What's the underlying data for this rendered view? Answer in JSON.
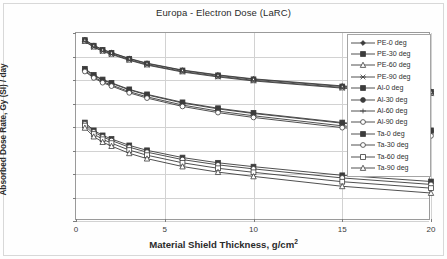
{
  "chart_data": {
    "type": "line",
    "title": "Europa - Electron Dose (LaRC)",
    "xlabel_main": "Material Shield Thickness, g/cm",
    "xlabel_sup": "2",
    "ylabel": "Absorbed Dose Rate, Gy (SI) / day",
    "xlim": [
      0,
      20
    ],
    "ylim": [
      1e-05,
      1000.0
    ],
    "yscale": "log",
    "grid": true,
    "legend_position": "upper-right-inside",
    "xticks": [
      "0",
      "5",
      "10",
      "15",
      "20"
    ],
    "xtick_values": [
      0,
      5,
      10,
      15,
      20
    ],
    "yticks": [
      "1.E+03",
      "1.E+02",
      "1.E+01",
      "1.E+00",
      "1.E-01",
      "1.E-02",
      "1.E-03",
      "1.E-04",
      "1.E-05"
    ],
    "ytick_values": [
      1000,
      100,
      10,
      1,
      0.1,
      0.01,
      0.001,
      0.0001,
      1e-05
    ],
    "x": [
      0.5,
      1,
      1.5,
      2,
      3,
      4,
      6,
      8,
      10,
      15,
      20
    ],
    "series": [
      {
        "name": "PE-0 deg",
        "marker": "diamond-filled",
        "values": [
          520,
          300,
          200,
          148,
          83,
          52,
          26.5,
          16.5,
          11.2,
          5.6,
          3.3
        ]
      },
      {
        "name": "PE-30 deg",
        "marker": "square-filled",
        "values": [
          500,
          288,
          192,
          142,
          80,
          50,
          25.5,
          15.8,
          10.7,
          5.3,
          3.1
        ]
      },
      {
        "name": "PE-60 deg",
        "marker": "triangle-open",
        "values": [
          455,
          262,
          175,
          130,
          73,
          45.5,
          23.2,
          14.4,
          9.7,
          4.8,
          2.8
        ]
      },
      {
        "name": "PE-90 deg",
        "marker": "cross-x",
        "values": [
          430,
          248,
          165,
          122,
          69,
          43,
          21.8,
          13.5,
          9.1,
          4.5,
          2.6
        ]
      },
      {
        "name": "Al-0 deg",
        "marker": "square-filled",
        "values": [
          30,
          16.5,
          10.5,
          7.6,
          4.0,
          2.45,
          1.12,
          0.63,
          0.4,
          0.155,
          0.072
        ]
      },
      {
        "name": "Al-30 deg",
        "marker": "circle-filled",
        "values": [
          28.5,
          15.6,
          9.9,
          7.2,
          3.8,
          2.32,
          1.05,
          0.59,
          0.375,
          0.145,
          0.067
        ]
      },
      {
        "name": "Al-60 deg",
        "marker": "plus",
        "values": [
          25,
          13.5,
          8.5,
          6.1,
          3.2,
          1.92,
          0.86,
          0.475,
          0.3,
          0.112,
          0.051
        ]
      },
      {
        "name": "Al-90 deg",
        "marker": "circle-open",
        "values": [
          23,
          12.3,
          7.7,
          5.5,
          2.85,
          1.7,
          0.75,
          0.41,
          0.255,
          0.094,
          0.042
        ]
      },
      {
        "name": "Ta-0 deg",
        "marker": "square-filled",
        "values": [
          0.155,
          0.072,
          0.044,
          0.031,
          0.0165,
          0.0102,
          0.005,
          0.003,
          0.00205,
          0.00088,
          0.00048
        ]
      },
      {
        "name": "Ta-30 deg",
        "marker": "circle-open",
        "values": [
          0.138,
          0.062,
          0.038,
          0.0265,
          0.0138,
          0.0085,
          0.0041,
          0.00245,
          0.00165,
          0.00068,
          0.00036
        ]
      },
      {
        "name": "Ta-60 deg",
        "marker": "square-open",
        "values": [
          0.115,
          0.05,
          0.03,
          0.0205,
          0.0104,
          0.0063,
          0.003,
          0.00175,
          0.00118,
          0.00047,
          0.00025
        ]
      },
      {
        "name": "Ta-90 deg",
        "marker": "triangle-open",
        "values": [
          0.092,
          0.039,
          0.0228,
          0.0154,
          0.0076,
          0.0045,
          0.00208,
          0.0012,
          0.00079,
          0.0003,
          0.000155
        ]
      }
    ]
  },
  "legend": {
    "entries": [
      "PE-0 deg",
      "PE-30 deg",
      "PE-60 deg",
      "PE-90 deg",
      "Al-0 deg",
      "Al-30 deg",
      "Al-60 deg",
      "Al-90 deg",
      "Ta-0 deg",
      "Ta-30 deg",
      "Ta-60 deg",
      "Ta-90 deg"
    ]
  },
  "colors": {
    "line": "#3c3c3c",
    "grid": "#d2d2d2",
    "axis": "#9a9a9a",
    "text": "#2b2b2b"
  }
}
